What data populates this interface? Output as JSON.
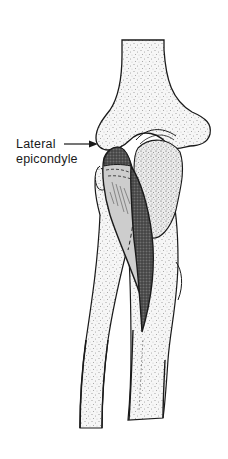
{
  "figure": {
    "type": "anatomical illustration",
    "annotations": [
      {
        "line1": "Lateral",
        "line2": "epicondyle",
        "arrow": "right-pointing-arrow"
      }
    ],
    "colors": {
      "background": "#ffffff",
      "outline": "#1a1a1a",
      "bone_fill": "#f4f4f4",
      "stipple": "#3a3a3a",
      "muscle_light": "#c9c9c9",
      "muscle_dark": "#4a4a4a"
    }
  }
}
